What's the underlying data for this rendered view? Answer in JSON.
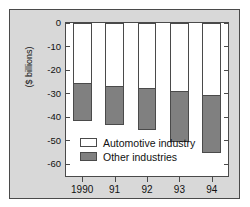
{
  "chart_data": {
    "type": "bar",
    "title": "",
    "subtitle": "",
    "xlabel": "",
    "ylabel": "($ billions)",
    "categories": [
      "1990",
      "91",
      "92",
      "93",
      "94"
    ],
    "series": [
      {
        "name": "Automotive industry",
        "color": "#ffffff",
        "values": [
          -25,
          -26.5,
          -27,
          -28.5,
          -30
        ]
      },
      {
        "name": "Other industries",
        "color": "#808080",
        "values": [
          -16,
          -16.5,
          -18,
          -21.5,
          -25
        ]
      }
    ],
    "totals": [
      -41,
      -43,
      -45,
      -50,
      -55
    ],
    "stacked": true,
    "ylim": [
      -65,
      0
    ],
    "yticks": [
      0,
      -10,
      -20,
      -30,
      -40,
      -50,
      -60
    ],
    "ytick_labels": [
      "0",
      "-10",
      "-20",
      "-30",
      "-40",
      "-50",
      "-60"
    ],
    "grid": false,
    "legend_position": "inside-lower-left",
    "note": "Stacked negative bars: white segment from 0 down to segment boundary, gray segment from boundary down to total."
  },
  "legend": {
    "items": [
      {
        "label": "Automotive industry",
        "swatch": "#ffffff"
      },
      {
        "label": "Other industries",
        "swatch": "#808080"
      }
    ]
  },
  "axis": {
    "y_caption": "($ billions)",
    "y_ticks": [
      "0",
      "-10",
      "-20",
      "-30",
      "-40",
      "-50",
      "-60"
    ],
    "x_ticks": [
      "1990",
      "91",
      "92",
      "93",
      "94"
    ]
  },
  "colors": {
    "panel_background": "#d8d8d8",
    "plot_background": "#ffffff",
    "border": "#4a4a4a",
    "gray_series": "#808080",
    "white_series": "#ffffff",
    "text": "#111111"
  }
}
